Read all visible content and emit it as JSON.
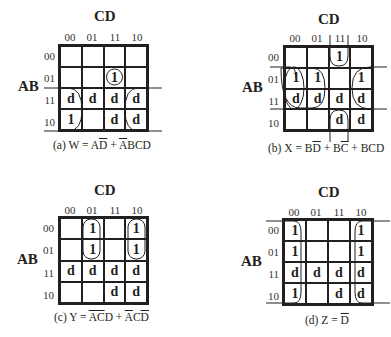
{
  "maps": [
    {
      "id": "a",
      "title": "CD",
      "row_var": "AB",
      "col_labels": [
        "00",
        "01",
        "11",
        "10"
      ],
      "row_labels": [
        "00",
        "01",
        "11",
        "10"
      ],
      "cells": [
        [
          "",
          "",
          "",
          ""
        ],
        [
          "",
          "",
          "1",
          ""
        ],
        [
          "d",
          "d",
          "d",
          "d"
        ],
        [
          "1",
          "",
          "d",
          "d"
        ]
      ],
      "caption": {
        "prefix": "(a) W = A",
        "t1": "D",
        "mid": " + ",
        "t2": "A",
        "suffix": "BCD"
      }
    },
    {
      "id": "b",
      "title": "CD",
      "row_var": "AB",
      "col_labels": [
        "00",
        "01",
        "11",
        "10"
      ],
      "row_labels": [
        "00",
        "01",
        "11",
        "10"
      ],
      "cells": [
        [
          "",
          "",
          "1",
          ""
        ],
        [
          "1",
          "1",
          "",
          "1"
        ],
        [
          "d",
          "d",
          "d",
          "d"
        ],
        [
          "",
          "",
          "d",
          "d"
        ]
      ],
      "caption": {
        "prefix": "(b) X = B",
        "t1": "D",
        "mid": " + B",
        "t2": "C",
        "suffix": " + BCD"
      }
    },
    {
      "id": "c",
      "title": "CD",
      "row_var": "AB",
      "col_labels": [
        "00",
        "01",
        "11",
        "10"
      ],
      "row_labels": [
        "00",
        "01",
        "11",
        "10"
      ],
      "cells": [
        [
          "",
          "1",
          "",
          "1"
        ],
        [
          "",
          "1",
          "",
          "1"
        ],
        [
          "d",
          "d",
          "d",
          "d"
        ],
        [
          "",
          "",
          "d",
          "d"
        ]
      ],
      "caption": {
        "prefix": "(c) Y = ",
        "t1": "A",
        "t1b": "C",
        "mid": "D + ",
        "t2": "A",
        "mid2": "C",
        "t3": "D"
      }
    },
    {
      "id": "d",
      "title": "CD",
      "row_var": "AB",
      "col_labels": [
        "00",
        "01",
        "11",
        "10"
      ],
      "row_labels": [
        "00",
        "01",
        "11",
        "10"
      ],
      "cells": [
        [
          "1",
          "",
          "",
          "1"
        ],
        [
          "1",
          "",
          "",
          "1"
        ],
        [
          "d",
          "d",
          "d",
          "d"
        ],
        [
          "1",
          "",
          "d",
          "d"
        ]
      ],
      "caption": {
        "prefix": "(d) Z = ",
        "t1": "D"
      }
    }
  ]
}
